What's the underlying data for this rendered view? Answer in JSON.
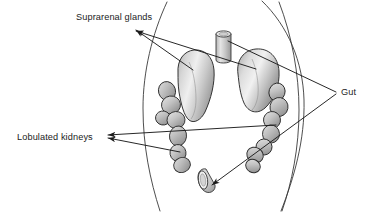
{
  "figure": {
    "kind": "anatomical-diagram",
    "background_color": "#ffffff",
    "ink_color": "#1b1b1b",
    "organ_fill_light": "#e6e6e6",
    "organ_fill_mid": "#bdbdbd",
    "organ_fill_dark": "#8f8f8f",
    "outline_color": "#2b2b2b"
  },
  "labels": [
    {
      "id": "suprarenal-glands",
      "text": "Suprarenal glands",
      "x": 76,
      "y": 20,
      "anchor": "start"
    },
    {
      "id": "lobulated-kidneys",
      "text": "Lobulated kidneys",
      "x": 17,
      "y": 140,
      "anchor": "start"
    },
    {
      "id": "gut",
      "text": "Gut",
      "x": 341,
      "y": 95,
      "anchor": "start"
    }
  ],
  "structures": [
    {
      "id": "left-suprarenal-gland",
      "name": "Left suprarenal gland"
    },
    {
      "id": "right-suprarenal-gland",
      "name": "Right suprarenal gland"
    },
    {
      "id": "left-lobulated-kidney",
      "name": "Left lobulated kidney"
    },
    {
      "id": "right-lobulated-kidney",
      "name": "Right lobulated kidney"
    },
    {
      "id": "upper-gut-tube",
      "name": "Upper cut gut tube"
    },
    {
      "id": "lower-gut-tube",
      "name": "Lower cut gut tube"
    },
    {
      "id": "body-outline-left",
      "name": "Left body wall outline"
    },
    {
      "id": "body-outline-right",
      "name": "Right body wall outline"
    },
    {
      "id": "body-outline-right-outer",
      "name": "Right outer body arc"
    }
  ]
}
